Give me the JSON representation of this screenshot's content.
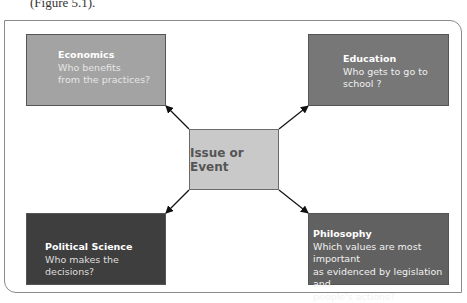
{
  "caption": "(Figure 5.1).",
  "center": {
    "label": "Issue or Event"
  },
  "nodes": [
    {
      "id": "economics",
      "title": "Economics",
      "body": [
        "Who benefits",
        "from the practices?"
      ],
      "fill": "#a3a3a3"
    },
    {
      "id": "education",
      "title": "Education",
      "body": [
        "Who gets to go to",
        "school ?"
      ],
      "fill": "#777777"
    },
    {
      "id": "political-science",
      "title": "Political Science",
      "body": [
        "Who makes the decisions?"
      ],
      "fill": "#3e3e3e"
    },
    {
      "id": "philosophy",
      "title": "Philosophy",
      "body": [
        "Which values are most important",
        "as evidenced by legislation and",
        "people's actions?"
      ],
      "fill": "#616161"
    }
  ],
  "colors": {
    "center_fill": "#c9c9c9",
    "frame": "#8a8a8a",
    "arrow": "#111111"
  }
}
